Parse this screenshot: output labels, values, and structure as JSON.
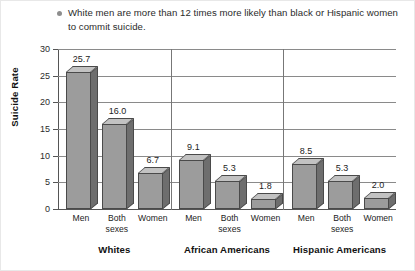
{
  "caption": {
    "bullet_icon": "bullet-dot-icon",
    "text": "White men are more than 12 times more likely than black or Hispanic women to commit suicide."
  },
  "chart_data": {
    "type": "bar",
    "title": "",
    "subtitle": "",
    "xlabel": "",
    "ylabel": "Suicide Rate",
    "ylim": [
      0,
      30
    ],
    "yticks": [
      0,
      5,
      10,
      15,
      20,
      25,
      30
    ],
    "ytick_labels": [
      "0",
      "5",
      "10",
      "15",
      "20",
      "25",
      "30"
    ],
    "grid": true,
    "legend": "none",
    "groups": [
      "Whites",
      "African Americans",
      "Hispanic Americans"
    ],
    "categories": [
      "Men",
      "Both sexes",
      "Women"
    ],
    "series": [
      {
        "name": "Whites",
        "values": [
          25.7,
          16.0,
          6.7
        ],
        "labels": [
          "25.7",
          "16.0",
          "6.7"
        ]
      },
      {
        "name": "African Americans",
        "values": [
          9.1,
          5.3,
          1.8
        ],
        "labels": [
          "9.1",
          "5.3",
          "1.8"
        ]
      },
      {
        "name": "Hispanic Americans",
        "values": [
          8.5,
          5.3,
          2.0
        ],
        "labels": [
          "8.5",
          "5.3",
          "2.0"
        ]
      }
    ],
    "colors": {
      "bar_front": "#9c9c9c",
      "bar_side": "#6e6e6e",
      "bar_top": "#c2c2c2",
      "bar_outline": "#4a4a4a",
      "gridline": "#8a8a8a",
      "axis": "#555555",
      "text": "#1c1c1c"
    }
  }
}
